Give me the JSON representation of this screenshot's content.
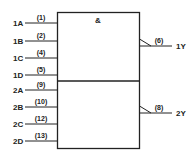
{
  "gate": {
    "symbol": "&"
  },
  "inputs": [
    {
      "name": "1A",
      "pin": "(1)"
    },
    {
      "name": "1B",
      "pin": "(2)"
    },
    {
      "name": "1C",
      "pin": "(4)"
    },
    {
      "name": "1D",
      "pin": "(5)"
    },
    {
      "name": "2A",
      "pin": "(9)"
    },
    {
      "name": "2B",
      "pin": "(10)"
    },
    {
      "name": "2C",
      "pin": "(12)"
    },
    {
      "name": "2D",
      "pin": "(13)"
    }
  ],
  "outputs": [
    {
      "name": "1Y",
      "pin": "(6)"
    },
    {
      "name": "2Y",
      "pin": "(8)"
    }
  ]
}
